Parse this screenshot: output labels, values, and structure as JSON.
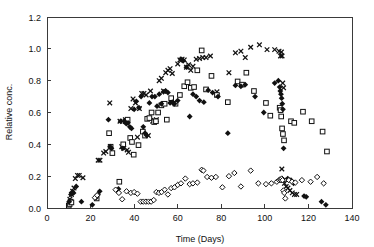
{
  "chart_data": {
    "type": "scatter",
    "title": "",
    "xlabel": "Time (Days)",
    "ylabel": "Relative conc.",
    "xlim": [
      0,
      140
    ],
    "ylim": [
      0.0,
      1.2
    ],
    "xticks": [
      0,
      20,
      40,
      60,
      80,
      100,
      120,
      140
    ],
    "yticks": [
      0.0,
      0.2,
      0.4,
      0.6,
      0.8,
      1.0,
      1.2
    ],
    "xtick_labels": [
      "0",
      "20",
      "40",
      "60",
      "80",
      "100",
      "120",
      "140"
    ],
    "ytick_labels": [
      "0.0",
      "0.2",
      "0.4",
      "0.6",
      "0.8",
      "1.0",
      "1.2"
    ],
    "grid": false,
    "legend": "none",
    "series": [
      {
        "name": "series-cross",
        "marker": "cross",
        "color": "#111111",
        "points": [
          [
            10.5,
            0.055
          ],
          [
            11.2,
            0.085
          ],
          [
            11.8,
            0.105
          ],
          [
            12.4,
            0.125
          ],
          [
            13.0,
            0.185
          ],
          [
            14.0,
            0.205
          ],
          [
            14.8,
            0.205
          ],
          [
            16.5,
            0.19
          ],
          [
            23.5,
            0.3
          ],
          [
            24.3,
            0.3
          ],
          [
            26.0,
            0.345
          ],
          [
            27.0,
            0.355
          ],
          [
            28.8,
            0.66
          ],
          [
            33.5,
            0.545
          ],
          [
            34.3,
            0.385
          ],
          [
            35.2,
            0.375
          ],
          [
            36.0,
            0.555
          ],
          [
            36.8,
            0.365
          ],
          [
            37.4,
            0.35
          ],
          [
            38.5,
            0.625
          ],
          [
            39.5,
            0.685
          ],
          [
            40.6,
            0.66
          ],
          [
            41.5,
            0.445
          ],
          [
            42.4,
            0.625
          ],
          [
            43.5,
            0.72
          ],
          [
            44.5,
            0.72
          ],
          [
            45.5,
            0.71
          ],
          [
            46.5,
            0.455
          ],
          [
            47.5,
            0.735
          ],
          [
            48.5,
            0.545
          ],
          [
            49.3,
            0.55
          ],
          [
            50.2,
            0.555
          ],
          [
            51.5,
            0.8
          ],
          [
            52.5,
            0.815
          ],
          [
            53.5,
            0.735
          ],
          [
            54.5,
            0.85
          ],
          [
            55.5,
            0.865
          ],
          [
            56.5,
            0.875
          ],
          [
            57.5,
            0.845
          ],
          [
            58.5,
            0.66
          ],
          [
            60.0,
            0.905
          ],
          [
            61.0,
            0.93
          ],
          [
            62.0,
            0.935
          ],
          [
            63.0,
            0.93
          ],
          [
            64.0,
            0.885
          ],
          [
            65.0,
            0.9
          ],
          [
            66.0,
            0.865
          ],
          [
            67.0,
            0.89
          ],
          [
            68.5,
            0.935
          ],
          [
            70.0,
            0.94
          ],
          [
            71.5,
            0.945
          ],
          [
            73.0,
            0.945
          ],
          [
            75.0,
            0.955
          ],
          [
            78.0,
            0.73
          ],
          [
            83.5,
            0.85
          ],
          [
            86.5,
            0.975
          ],
          [
            89.0,
            0.985
          ],
          [
            91.0,
            0.945
          ],
          [
            93.5,
            1.01
          ],
          [
            97.5,
            1.025
          ],
          [
            101.0,
            0.995
          ],
          [
            104.5,
            0.995
          ],
          [
            106.5,
            0.985
          ],
          [
            107.2,
            0.955
          ],
          [
            107.6,
            0.98
          ],
          [
            107.9,
            0.955
          ],
          [
            108.2,
            0.785
          ],
          [
            108.6,
            0.755
          ],
          [
            107.8,
            0.245
          ],
          [
            108.4,
            0.175
          ],
          [
            109.0,
            0.155
          ],
          [
            109.8,
            0.135
          ],
          [
            110.6,
            0.125
          ],
          [
            111.5,
            0.11
          ],
          [
            112.6,
            0.095
          ],
          [
            113.6,
            0.085
          ],
          [
            114.6,
            0.085
          ]
        ]
      },
      {
        "name": "series-open-square",
        "marker": "square",
        "color": "#111111",
        "points": [
          [
            10.0,
            0.015
          ],
          [
            10.4,
            0.025
          ],
          [
            10.8,
            0.04
          ],
          [
            11.2,
            0.035
          ],
          [
            22.8,
            0.06
          ],
          [
            28.5,
            0.47
          ],
          [
            29.2,
            0.385
          ],
          [
            30.0,
            0.345
          ],
          [
            33.2,
            0.165
          ],
          [
            35.0,
            0.4
          ],
          [
            36.2,
            0.545
          ],
          [
            37.0,
            0.555
          ],
          [
            38.2,
            0.44
          ],
          [
            39.0,
            0.415
          ],
          [
            39.8,
            0.335
          ],
          [
            42.0,
            0.395
          ],
          [
            44.0,
            0.48
          ],
          [
            45.0,
            0.455
          ],
          [
            46.0,
            0.56
          ],
          [
            47.0,
            0.565
          ],
          [
            48.0,
            0.6
          ],
          [
            49.2,
            0.54
          ],
          [
            50.0,
            0.545
          ],
          [
            51.0,
            0.6
          ],
          [
            52.5,
            0.645
          ],
          [
            54.0,
            0.655
          ],
          [
            55.0,
            0.555
          ],
          [
            57.0,
            0.69
          ],
          [
            59.0,
            0.655
          ],
          [
            61.0,
            0.71
          ],
          [
            63.0,
            0.765
          ],
          [
            64.5,
            0.79
          ],
          [
            66.0,
            0.755
          ],
          [
            67.5,
            0.76
          ],
          [
            69.0,
            0.865
          ],
          [
            71.0,
            0.99
          ],
          [
            73.0,
            0.745
          ],
          [
            75.5,
            0.83
          ],
          [
            78.0,
            0.71
          ],
          [
            83.0,
            0.665
          ],
          [
            87.5,
            0.795
          ],
          [
            89.5,
            0.775
          ],
          [
            91.5,
            0.85
          ],
          [
            95.0,
            0.735
          ],
          [
            100.5,
            0.66
          ],
          [
            102.5,
            0.58
          ],
          [
            106.8,
            0.63
          ],
          [
            107.2,
            0.615
          ],
          [
            107.5,
            0.575
          ],
          [
            107.9,
            0.5
          ],
          [
            108.3,
            0.465
          ],
          [
            108.8,
            0.425
          ],
          [
            112.0,
            0.545
          ],
          [
            113.5,
            0.535
          ],
          [
            117.5,
            0.605
          ],
          [
            121.5,
            0.545
          ],
          [
            126.5,
            0.48
          ],
          [
            128.5,
            0.355
          ]
        ]
      },
      {
        "name": "series-filled-diamond",
        "marker": "fdiamond",
        "color": "#111111",
        "points": [
          [
            10.2,
            0.04
          ],
          [
            11.0,
            0.085
          ],
          [
            11.6,
            0.1
          ],
          [
            12.2,
            0.095
          ],
          [
            13.4,
            0.135
          ],
          [
            15.8,
            0.04
          ],
          [
            20.8,
            0.02
          ],
          [
            22.5,
            0.065
          ],
          [
            23.4,
            0.085
          ],
          [
            24.2,
            0.105
          ],
          [
            28.2,
            0.555
          ],
          [
            29.0,
            0.385
          ],
          [
            29.6,
            0.375
          ],
          [
            32.8,
            0.12
          ],
          [
            33.8,
            0.545
          ],
          [
            34.8,
            0.375
          ],
          [
            35.6,
            0.545
          ],
          [
            36.4,
            0.53
          ],
          [
            37.2,
            0.535
          ],
          [
            38.0,
            0.51
          ],
          [
            38.8,
            0.5
          ],
          [
            40.0,
            0.62
          ],
          [
            41.0,
            0.67
          ],
          [
            42.2,
            0.63
          ],
          [
            43.2,
            0.7
          ],
          [
            44.2,
            0.51
          ],
          [
            45.0,
            0.47
          ],
          [
            45.8,
            0.455
          ],
          [
            47.0,
            0.66
          ],
          [
            48.2,
            0.7
          ],
          [
            49.5,
            0.7
          ],
          [
            50.5,
            0.64
          ],
          [
            51.5,
            0.715
          ],
          [
            52.5,
            0.655
          ],
          [
            53.5,
            0.73
          ],
          [
            54.5,
            0.735
          ],
          [
            55.5,
            0.725
          ],
          [
            56.5,
            0.66
          ],
          [
            57.5,
            0.665
          ],
          [
            58.5,
            0.655
          ],
          [
            60.0,
            0.675
          ],
          [
            61.5,
            0.935
          ],
          [
            62.5,
            0.925
          ],
          [
            64.0,
            0.885
          ],
          [
            65.5,
            0.575
          ],
          [
            67.0,
            0.715
          ],
          [
            68.5,
            0.7
          ],
          [
            70.0,
            0.675
          ],
          [
            72.0,
            0.665
          ],
          [
            74.0,
            0.74
          ],
          [
            76.0,
            0.725
          ],
          [
            78.5,
            0.7
          ],
          [
            83.0,
            0.47
          ],
          [
            86.5,
            0.77
          ],
          [
            89.0,
            0.765
          ],
          [
            91.0,
            0.775
          ],
          [
            95.5,
            0.7
          ],
          [
            99.5,
            0.6
          ],
          [
            104.5,
            0.785
          ],
          [
            106.2,
            0.8
          ],
          [
            106.8,
            0.76
          ],
          [
            107.1,
            0.735
          ],
          [
            107.4,
            0.715
          ],
          [
            107.7,
            0.69
          ],
          [
            108.0,
            0.655
          ],
          [
            108.3,
            0.62
          ],
          [
            108.6,
            0.375
          ],
          [
            110.5,
            0.185
          ],
          [
            112.0,
            0.175
          ],
          [
            113.2,
            0.155
          ],
          [
            118.0,
            0.075
          ],
          [
            119.0,
            0.07
          ],
          [
            126.0,
            0.04
          ],
          [
            128.0,
            0.02
          ]
        ]
      },
      {
        "name": "series-open-diamond",
        "marker": "odiamond",
        "color": "#111111",
        "points": [
          [
            22.0,
            0.065
          ],
          [
            23.0,
            0.08
          ],
          [
            31.5,
            0.115
          ],
          [
            33.0,
            0.095
          ],
          [
            34.5,
            0.055
          ],
          [
            36.5,
            0.105
          ],
          [
            38.5,
            0.095
          ],
          [
            40.0,
            0.1
          ],
          [
            41.5,
            0.09
          ],
          [
            43.0,
            0.04
          ],
          [
            44.2,
            0.04
          ],
          [
            45.4,
            0.04
          ],
          [
            46.6,
            0.04
          ],
          [
            47.8,
            0.04
          ],
          [
            49.0,
            0.05
          ],
          [
            50.2,
            0.1
          ],
          [
            51.4,
            0.095
          ],
          [
            52.6,
            0.1
          ],
          [
            54.0,
            0.115
          ],
          [
            55.5,
            0.085
          ],
          [
            57.0,
            0.125
          ],
          [
            58.5,
            0.13
          ],
          [
            60.0,
            0.145
          ],
          [
            61.5,
            0.155
          ],
          [
            63.5,
            0.185
          ],
          [
            65.5,
            0.15
          ],
          [
            67.0,
            0.155
          ],
          [
            69.0,
            0.16
          ],
          [
            71.0,
            0.24
          ],
          [
            71.8,
            0.235
          ],
          [
            73.5,
            0.195
          ],
          [
            75.5,
            0.19
          ],
          [
            77.5,
            0.195
          ],
          [
            80.5,
            0.13
          ],
          [
            83.5,
            0.2
          ],
          [
            86.0,
            0.22
          ],
          [
            89.0,
            0.135
          ],
          [
            93.5,
            0.235
          ],
          [
            97.0,
            0.155
          ],
          [
            100.5,
            0.15
          ],
          [
            103.0,
            0.155
          ],
          [
            105.5,
            0.165
          ],
          [
            106.5,
            0.175
          ],
          [
            107.0,
            0.18
          ],
          [
            107.4,
            0.175
          ],
          [
            107.8,
            0.185
          ],
          [
            108.1,
            0.175
          ],
          [
            108.5,
            0.11
          ],
          [
            108.9,
            0.095
          ],
          [
            109.4,
            0.06
          ],
          [
            111.0,
            0.175
          ],
          [
            112.5,
            0.165
          ],
          [
            114.0,
            0.16
          ],
          [
            117.0,
            0.175
          ],
          [
            121.0,
            0.165
          ],
          [
            124.0,
            0.195
          ],
          [
            127.0,
            0.155
          ]
        ]
      }
    ]
  }
}
